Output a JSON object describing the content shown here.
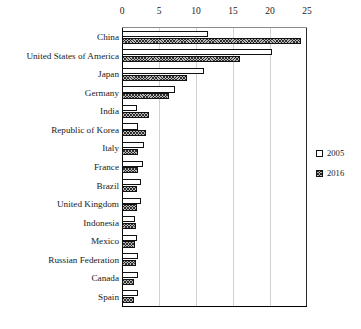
{
  "chart_data": {
    "type": "bar",
    "orientation": "horizontal",
    "title": "",
    "subtitle": "",
    "xlabel": "",
    "ylabel": "",
    "xlim": [
      0,
      25
    ],
    "ylim": null,
    "grid": true,
    "xticks": [
      "0",
      "5",
      "10",
      "15",
      "20",
      "25"
    ],
    "xtick_values": [
      0,
      5,
      10,
      15,
      20,
      25
    ],
    "legend_position": "right",
    "categories": [
      "China",
      "United States of America",
      "Japan",
      "Germany",
      "India",
      "Republic of Korea",
      "Italy",
      "France",
      "Brazil",
      "United Kingdom",
      "Indonesia",
      "Mexico",
      "Russian Federation",
      "Canada",
      "Spain"
    ],
    "series": [
      {
        "name": "2005",
        "pattern": "solid-white",
        "values": [
          11.6,
          20.3,
          11.1,
          7.2,
          2.0,
          2.2,
          3.0,
          2.8,
          2.6,
          2.5,
          1.8,
          2.0,
          2.2,
          2.2,
          2.2
        ]
      },
      {
        "name": "2016",
        "pattern": "crosshatch",
        "values": [
          24.2,
          16.0,
          8.8,
          6.4,
          3.6,
          3.2,
          2.2,
          2.2,
          2.0,
          2.0,
          1.9,
          1.8,
          1.9,
          1.6,
          1.6
        ]
      }
    ]
  },
  "legend": {
    "items": [
      {
        "label": "2005",
        "swatch": "empty-square-icon"
      },
      {
        "label": "2016",
        "swatch": "hatched-square-icon"
      }
    ]
  },
  "colors": {
    "series_2005_fill": "#ffffff",
    "series_2016_fill": "#b9b9b9",
    "bar_outline": "#111111",
    "gridline": "#d2d2d2",
    "axis": "#000000",
    "text": "#1a1a1a",
    "background": "#ffffff"
  }
}
